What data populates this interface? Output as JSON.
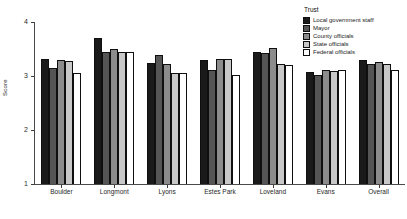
{
  "chart_data": {
    "type": "bar",
    "title": "",
    "xlabel": "",
    "ylabel": "Score",
    "ylim": [
      1,
      4
    ],
    "yticks": [
      1,
      2,
      3,
      4
    ],
    "grid": false,
    "legend_position": "top-right",
    "legend_title": "Trust",
    "categories": [
      "Boulder",
      "Longmont",
      "Lyons",
      "Estes Park",
      "Loveland",
      "Evans",
      "Overall"
    ],
    "series": [
      {
        "name": "Local government staff",
        "color": "#1a1a1a",
        "values": [
          3.32,
          3.7,
          3.25,
          3.3,
          3.45,
          3.07,
          3.3
        ]
      },
      {
        "name": "Mayor",
        "color": "#555555",
        "values": [
          3.15,
          3.45,
          3.38,
          3.12,
          3.42,
          3.02,
          3.22
        ]
      },
      {
        "name": "County officials",
        "color": "#8c8c8c",
        "values": [
          3.3,
          3.5,
          3.22,
          3.32,
          3.52,
          3.12,
          3.26
        ]
      },
      {
        "name": "State officials",
        "color": "#c8c8c8",
        "values": [
          3.28,
          3.45,
          3.05,
          3.32,
          3.22,
          3.1,
          3.22
        ]
      },
      {
        "name": "Federal officials",
        "color": "#ffffff",
        "values": [
          3.05,
          3.44,
          3.06,
          3.02,
          3.2,
          3.12,
          3.12
        ]
      }
    ]
  }
}
